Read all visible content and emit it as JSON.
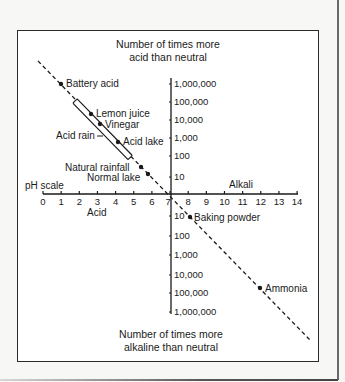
{
  "diagram": {
    "top_title_lines": [
      "Number of times more",
      "acid than neutral"
    ],
    "bottom_title_lines": [
      "Number of times more",
      "alkaline than neutral"
    ],
    "ph_axis_label": "pH scale",
    "acid_label": "Acid",
    "alkali_label": "Alkali",
    "ph_ticks": [
      "0",
      "1",
      "2",
      "3",
      "4",
      "5",
      "6",
      "7",
      "8",
      "9",
      "10",
      "11",
      "12",
      "13",
      "14"
    ],
    "acid_scale_ticks": [
      "1,000,000",
      "100,000",
      "10,000",
      "1,000",
      "100",
      "10"
    ],
    "alkaline_scale_ticks": [
      "10",
      "100",
      "1,000",
      "10,000",
      "100,000",
      "1,000,000"
    ],
    "substances": [
      {
        "name": "Battery acid",
        "ph": 1.0,
        "side": "right"
      },
      {
        "name": "Lemon juice",
        "ph": 2.3,
        "side": "right"
      },
      {
        "name": "Vinegar",
        "ph": 2.8,
        "side": "right"
      },
      {
        "name": "Acid rain",
        "ph_range": [
          2.0,
          5.0
        ],
        "side": "left",
        "kind": "range"
      },
      {
        "name": "Acid lake",
        "ph": 4.2,
        "side": "right"
      },
      {
        "name": "Natural rainfall",
        "ph": 5.6,
        "side": "left"
      },
      {
        "name": "Normal lake",
        "ph": 6.0,
        "side": "left"
      },
      {
        "name": "Baking powder",
        "ph": 8.2,
        "side": "right"
      },
      {
        "name": "Ammonia",
        "ph": 12.0,
        "side": "right"
      }
    ],
    "colors": {
      "ink": "#1a1a1a",
      "paper": "#ffffff",
      "background": "#f7f7f5"
    }
  }
}
